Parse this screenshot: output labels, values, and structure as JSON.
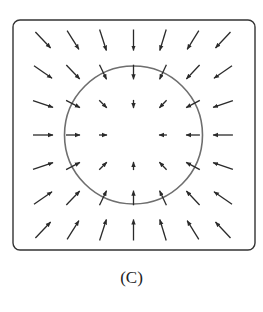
{
  "figure": {
    "caption": "(C)",
    "frame": {
      "x": 13,
      "y": 20,
      "width": 242,
      "height": 230,
      "radius": 7,
      "stroke": "#333333",
      "stroke_width": 1.4
    },
    "circle": {
      "cx": 133.5,
      "cy": 135,
      "r": 69,
      "stroke": "#6e6e6e",
      "stroke_width": 1.6
    },
    "arrow_color": "#2a2a2a",
    "grid": {
      "columns_x": [
        43,
        73,
        103,
        133.5,
        163,
        193,
        223
      ],
      "rows_y": [
        40,
        72,
        104,
        135,
        166,
        198,
        230
      ],
      "field": "inward-radial",
      "max_length": 22,
      "scale_per_px": 0.2,
      "skip_center": true
    }
  }
}
